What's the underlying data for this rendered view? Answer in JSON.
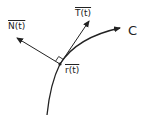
{
  "diagram": {
    "type": "vector-diagram",
    "labels": {
      "normal": "N(t)",
      "tangent": "T(t)",
      "position": "r(t)",
      "curve": "C"
    },
    "colors": {
      "stroke": "#222222",
      "background": "#ffffff"
    },
    "elements": [
      {
        "id": "curve-C",
        "kind": "curve-with-arrow",
        "label": "C"
      },
      {
        "id": "tangent-vector",
        "kind": "arrow",
        "label": "T(t)"
      },
      {
        "id": "normal-vector",
        "kind": "arrow",
        "label": "N(t)"
      },
      {
        "id": "point-r",
        "kind": "point",
        "label": "r(t)"
      },
      {
        "id": "right-angle-marker",
        "kind": "marker"
      }
    ]
  }
}
